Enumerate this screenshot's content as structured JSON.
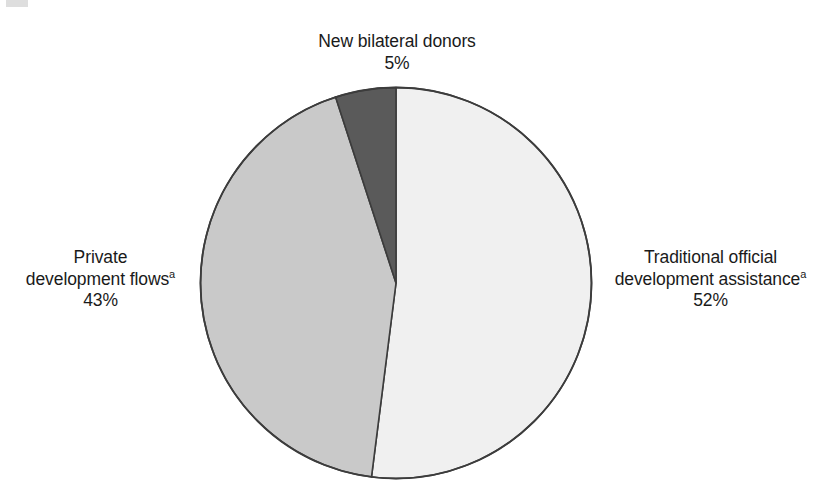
{
  "figure": {
    "background_color": "#ffffff",
    "text_color": "#1a1a1a",
    "footnote_marker": "a"
  },
  "chart_data": {
    "type": "pie",
    "title": "",
    "subtitle": "",
    "xlabel": "",
    "ylabel": "",
    "legend_position": "none",
    "grid": false,
    "units": "percent",
    "total": 100,
    "start_angle_deg": 0,
    "direction": "clockwise",
    "center": {
      "x": 396,
      "y": 283,
      "radius": 197
    },
    "categories": [
      "Traditional official development assistance",
      "Private development flows",
      "New bilateral donors"
    ],
    "values": [
      52,
      43,
      5
    ],
    "slices": [
      {
        "name": "Traditional official development assistance",
        "label_line1": "Traditional official",
        "label_line2": "development assistance",
        "has_footnote": true,
        "value": 52,
        "value_label": "52%",
        "color": "#f0f0f0",
        "stroke": "#3c3c3c",
        "start_angle_deg": 0,
        "end_angle_deg": 187.2
      },
      {
        "name": "Private development flows",
        "label_line1": "Private",
        "label_line2": "development flows",
        "has_footnote": true,
        "value": 43,
        "value_label": "43%",
        "color": "#c9c9c9",
        "stroke": "#3c3c3c",
        "start_angle_deg": 187.2,
        "end_angle_deg": 342.0
      },
      {
        "name": "New bilateral donors",
        "label_line1": "New bilateral donors",
        "label_line2": "",
        "has_footnote": false,
        "value": 5,
        "value_label": "5%",
        "color": "#5a5a5a",
        "stroke": "#3c3c3c",
        "start_angle_deg": 342.0,
        "end_angle_deg": 360.0
      }
    ]
  },
  "labels": {
    "new_bilateral_donors": {
      "line1": "New bilateral donors",
      "percent": "5%"
    },
    "traditional_oda": {
      "line1": "Traditional official",
      "line2": "development assistance",
      "footnote": "a",
      "percent": "52%"
    },
    "private_flows": {
      "line1": "Private",
      "line2": "development flows",
      "footnote": "a",
      "percent": "43%"
    }
  }
}
